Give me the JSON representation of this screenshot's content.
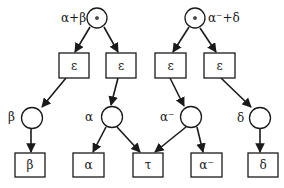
{
  "diagram": {
    "type": "tree / directed graph",
    "colors": {
      "stroke": "#1a1a1a",
      "fill": "#ffffff"
    },
    "roots": [
      {
        "id": "root1",
        "label": "α+β",
        "symbol": "•"
      },
      {
        "id": "root2",
        "label": "α⁻+δ",
        "symbol": "•"
      }
    ],
    "epsilon_boxes": [
      {
        "id": "e1",
        "label": "ε"
      },
      {
        "id": "e2",
        "label": "ε"
      },
      {
        "id": "e3",
        "label": "ε"
      },
      {
        "id": "e4",
        "label": "ε"
      }
    ],
    "mid_circles": [
      {
        "id": "c_beta",
        "label": "β"
      },
      {
        "id": "c_alpha",
        "label": "α"
      },
      {
        "id": "c_alpham",
        "label": "α⁻"
      },
      {
        "id": "c_delta",
        "label": "δ"
      }
    ],
    "leaf_boxes": [
      {
        "id": "l_beta",
        "label": "β"
      },
      {
        "id": "l_alpha",
        "label": "α"
      },
      {
        "id": "l_tau",
        "label": "τ"
      },
      {
        "id": "l_alpham",
        "label": "α⁻"
      },
      {
        "id": "l_delta",
        "label": "δ"
      }
    ],
    "edges": [
      [
        "root1",
        "e1"
      ],
      [
        "root1",
        "e2"
      ],
      [
        "root2",
        "e3"
      ],
      [
        "root2",
        "e4"
      ],
      [
        "e1",
        "c_beta"
      ],
      [
        "e2",
        "c_alpha"
      ],
      [
        "e3",
        "c_alpham"
      ],
      [
        "e4",
        "c_delta"
      ],
      [
        "c_beta",
        "l_beta"
      ],
      [
        "c_alpha",
        "l_alpha"
      ],
      [
        "c_alpha",
        "l_tau"
      ],
      [
        "c_alpham",
        "l_tau"
      ],
      [
        "c_alpham",
        "l_alpham"
      ],
      [
        "c_delta",
        "l_delta"
      ]
    ]
  }
}
